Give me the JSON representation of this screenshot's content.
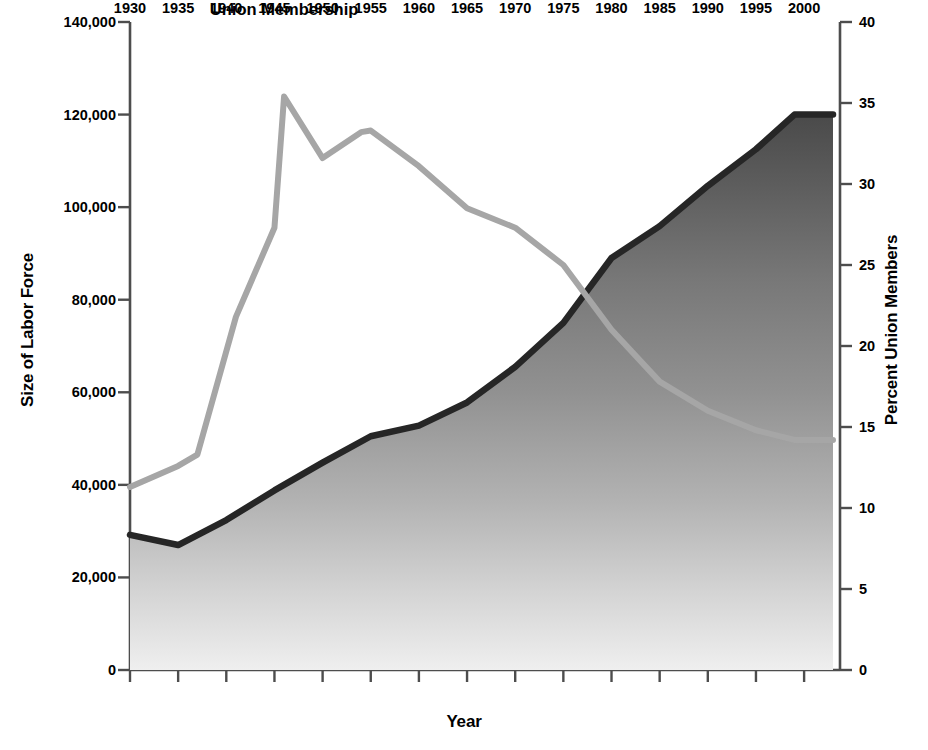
{
  "chart_data": {
    "type": "line",
    "title": "",
    "xlabel": "Year",
    "ylabel": "Size of Labor Force",
    "ylabel_right": "Percent Union Members",
    "xlim": [
      1930,
      2003
    ],
    "ylim": [
      0,
      140000
    ],
    "ylim_right": [
      0,
      40
    ],
    "grid": false,
    "legend_position": "inline-annotations",
    "xticks": [
      "1930",
      "1935",
      "1940",
      "1945",
      "1950",
      "1955",
      "1960",
      "1965",
      "1970",
      "1975",
      "1980",
      "1985",
      "1990",
      "1995",
      "2000"
    ],
    "yticks_left": [
      "0",
      "20,000",
      "40,000",
      "60,000",
      "80,000",
      "100,000",
      "120,000",
      "140,000"
    ],
    "yticks_right": [
      "0",
      "5",
      "10",
      "15",
      "20",
      "25",
      "30",
      "35",
      "40"
    ],
    "series": [
      {
        "name": "Labor Force",
        "axis": "left",
        "style": "area",
        "color": "#262626",
        "annotation": "Labor Force",
        "x": [
          1930,
          1935,
          1940,
          1945,
          1950,
          1955,
          1960,
          1965,
          1970,
          1975,
          1980,
          1985,
          1990,
          1995,
          1999,
          2003
        ],
        "values": [
          29200,
          27000,
          32400,
          38800,
          44800,
          50500,
          52800,
          57800,
          65500,
          75000,
          89000,
          95900,
          104600,
          112500,
          120000,
          120000
        ]
      },
      {
        "name": "Union Membership",
        "axis": "right",
        "style": "line",
        "color": "#a6a6a6",
        "annotation": "Union Membership",
        "x": [
          1930,
          1935,
          1937,
          1941,
          1945,
          1946,
          1950,
          1954,
          1955,
          1960,
          1965,
          1970,
          1975,
          1980,
          1985,
          1990,
          1995,
          1999,
          2003
        ],
        "values": [
          11.3,
          12.6,
          13.3,
          21.8,
          27.3,
          35.4,
          31.6,
          33.2,
          33.3,
          31.1,
          28.5,
          27.3,
          25.0,
          21.0,
          17.8,
          16.0,
          14.8,
          14.2,
          14.2
        ]
      }
    ],
    "annotations": [
      {
        "text": "Union Membership",
        "x": 1946,
        "y_right": 40.8
      },
      {
        "text": "Labor Force",
        "x": 1968,
        "y_left": 20500
      }
    ]
  },
  "axes": {
    "left_title": "Size of Labor Force",
    "right_title": "Percent Union Members",
    "x_title": "Year"
  },
  "colors": {
    "labor_force_line": "#262626",
    "labor_force_fill_top": "#555555",
    "labor_force_fill_bottom": "#efefef",
    "union_line": "#a6a6a6",
    "axis": "#4d4d4d",
    "text": "#000000"
  }
}
